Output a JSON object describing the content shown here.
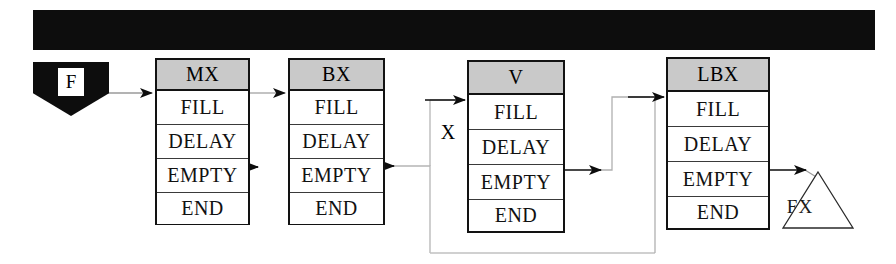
{
  "diagram": {
    "title_bar": {
      "label": "X"
    },
    "source_node": {
      "label": "F",
      "shape": "pentagon"
    },
    "sink_node": {
      "label": "FX",
      "shape": "triangle"
    },
    "row_labels": [
      "FILL",
      "DELAY",
      "EMPTY",
      "END"
    ],
    "boxes": [
      {
        "id": "mx",
        "header": "MX",
        "rows": [
          "FILL",
          "DELAY",
          "EMPTY",
          "END"
        ]
      },
      {
        "id": "bx",
        "header": "BX",
        "rows": [
          "FILL",
          "DELAY",
          "EMPTY",
          "END"
        ]
      },
      {
        "id": "v",
        "header": "V",
        "rows": [
          "FILL",
          "DELAY",
          "EMPTY",
          "END"
        ]
      },
      {
        "id": "lbx",
        "header": "LBX",
        "rows": [
          "FILL",
          "DELAY",
          "EMPTY",
          "END"
        ]
      }
    ],
    "colors": {
      "bar_fill": "#0d0d0d",
      "header_fill": "#c9c9c9",
      "box_fill": "#ffffff",
      "stroke": "#121212",
      "connector": "#9a9a9a",
      "page": "#ffffff"
    }
  }
}
